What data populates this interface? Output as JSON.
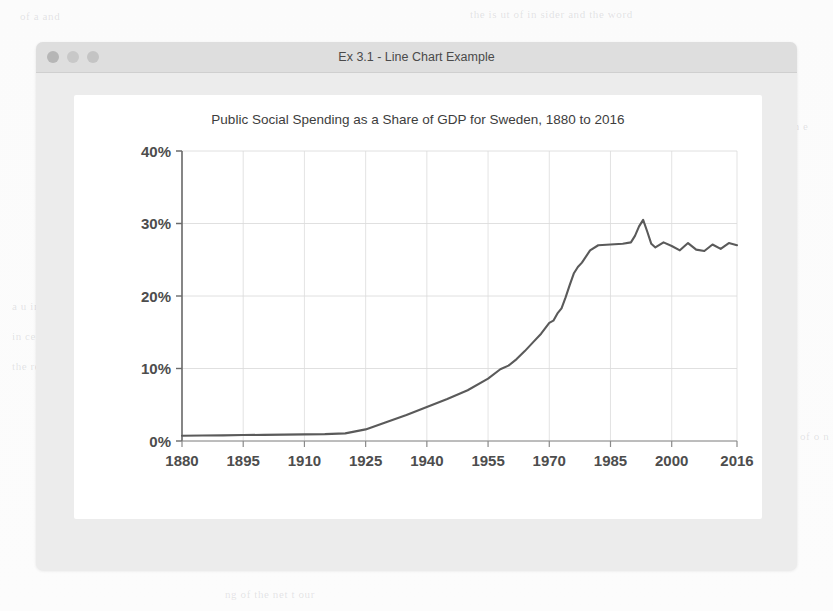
{
  "window": {
    "title": "Ex 3.1 - Line Chart Example",
    "traffic_lights": [
      {
        "name": "close",
        "color": "#b6b6b6"
      },
      {
        "name": "minimize",
        "color": "#c8c8c8"
      },
      {
        "name": "zoom",
        "color": "#c4c4c4"
      }
    ],
    "chrome_color": "#dedede",
    "body_color": "#ececec",
    "canvas_color": "#ffffff"
  },
  "chart_data": {
    "type": "line",
    "title": "Public Social Spending as a Share of GDP for Sweden, 1880 to 2016",
    "xlabel": "",
    "ylabel": "",
    "xlim": [
      1880,
      2016
    ],
    "ylim": [
      0,
      40
    ],
    "grid": true,
    "legend": null,
    "line_color": "#5a5a5a",
    "y_tick_labels": [
      "0%",
      "10%",
      "20%",
      "30%",
      "40%"
    ],
    "y_tick_values": [
      0,
      10,
      20,
      30,
      40
    ],
    "x_tick_labels": [
      "1880",
      "1895",
      "1910",
      "1925",
      "1940",
      "1955",
      "1970",
      "1985",
      "2000",
      "2016"
    ],
    "x_tick_values": [
      1880,
      1895,
      1910,
      1925,
      1940,
      1955,
      1970,
      1985,
      2000,
      2016
    ],
    "series": [
      {
        "name": "Sweden",
        "x": [
          1880,
          1885,
          1890,
          1895,
          1900,
          1905,
          1910,
          1915,
          1920,
          1925,
          1930,
          1935,
          1940,
          1945,
          1950,
          1955,
          1958,
          1960,
          1962,
          1964,
          1966,
          1968,
          1970,
          1971,
          1972,
          1973,
          1974,
          1975,
          1976,
          1977,
          1978,
          1980,
          1982,
          1985,
          1988,
          1990,
          1991,
          1992,
          1993,
          1994,
          1995,
          1996,
          1998,
          2000,
          2002,
          2004,
          2006,
          2008,
          2010,
          2012,
          2014,
          2016
        ],
        "y": [
          0.72,
          0.75,
          0.78,
          0.82,
          0.85,
          0.88,
          0.92,
          0.95,
          1.05,
          1.6,
          2.6,
          3.6,
          4.7,
          5.8,
          7.0,
          8.6,
          9.9,
          10.4,
          11.3,
          12.4,
          13.6,
          14.8,
          16.3,
          16.6,
          17.6,
          18.3,
          19.8,
          21.5,
          23.1,
          24.0,
          24.6,
          26.3,
          27.0,
          27.1,
          27.2,
          27.4,
          28.3,
          29.6,
          30.5,
          28.9,
          27.2,
          26.7,
          27.4,
          26.9,
          26.3,
          27.3,
          26.4,
          26.2,
          27.1,
          26.5,
          27.3,
          27.0
        ],
        "color": "#5a5a5a",
        "width": 2.1
      }
    ]
  },
  "ghost_text": [
    {
      "text": "the is ut of in sider and the word",
      "x": 470,
      "y": 8,
      "size": 11
    },
    {
      "text": "of  a  and",
      "x": 20,
      "y": 10,
      "size": 11
    },
    {
      "text": "in e",
      "x": 790,
      "y": 120,
      "size": 11
    },
    {
      "text": "a u in tes",
      "x": 12,
      "y": 300,
      "size": 11
    },
    {
      "text": "in ce of the",
      "x": 12,
      "y": 330,
      "size": 11
    },
    {
      "text": "the ret urn ence",
      "x": 12,
      "y": 360,
      "size": 11
    },
    {
      "text": "ng of the net t our",
      "x": 225,
      "y": 588,
      "size": 11
    },
    {
      "text": "of o n",
      "x": 800,
      "y": 430,
      "size": 11
    }
  ]
}
